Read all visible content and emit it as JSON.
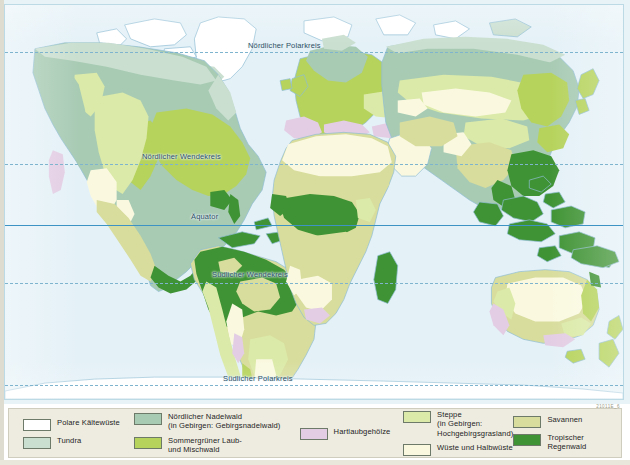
{
  "map": {
    "title": "Vegetationszonen der Erde",
    "plate_code": "21011E_6",
    "ocean_color": "#e4f1f7",
    "coastline_color": "#8fbdd4",
    "latitude_lines": [
      {
        "id": "arctic-circle",
        "label": "Nördlicher Polarkreis",
        "y": 51,
        "label_x": 247,
        "label_y": 41,
        "style": "dashed"
      },
      {
        "id": "tropic-cancer",
        "label": "Nördlicher Wendekreis",
        "y": 163,
        "label_x": 141,
        "label_y": 152,
        "style": "dashed"
      },
      {
        "id": "equator",
        "label": "Äquator",
        "y": 224,
        "label_x": 190,
        "label_y": 212,
        "style": "solid"
      },
      {
        "id": "tropic-capricorn",
        "label": "Südlicher Wendekreis",
        "y": 282,
        "label_x": 211,
        "label_y": 270,
        "style": "dashed"
      },
      {
        "id": "antarctic-circle",
        "label": "Südlicher Polarkreis",
        "y": 384,
        "label_x": 222,
        "label_y": 374,
        "style": "dashed"
      }
    ]
  },
  "legend": {
    "columns": [
      {
        "items": [
          {
            "label": "Polare Kältewüste",
            "color": "#ffffff"
          },
          {
            "label": "Tundra",
            "color": "#cadfd0"
          }
        ]
      },
      {
        "items": [
          {
            "label": "Nördlicher Nadelwald\n(in Gebirgen: Gebirgsnadelwald)",
            "color": "#a8cbb4"
          },
          {
            "label": "Sommergrüner Laub-\nund Mischwald",
            "color": "#b6d35c"
          }
        ]
      },
      {
        "items": [
          {
            "label": "Hartlaubgehölze",
            "color": "#e3cde4"
          }
        ]
      },
      {
        "items": [
          {
            "label": "Steppe\n(in Gebirgen:\nHochgebirgsgrasland)",
            "color": "#dbeaa8"
          },
          {
            "label": "Wüste und Halbwüste",
            "color": "#faf9e0"
          }
        ]
      },
      {
        "items": [
          {
            "label": "Savannen",
            "color": "#d8dd9d"
          },
          {
            "label": "Tropischer\nRegenwald",
            "color": "#3f9334"
          }
        ]
      }
    ]
  },
  "biome_colors": {
    "polar_desert": "#ffffff",
    "tundra": "#cadfd0",
    "boreal_forest": "#a8cbb4",
    "deciduous_mixed_forest": "#b6d35c",
    "sclerophyll": "#e3cde4",
    "steppe": "#dbeaa8",
    "desert": "#faf9e0",
    "savanna": "#d8dd9d",
    "tropical_rainforest": "#3f9334"
  }
}
